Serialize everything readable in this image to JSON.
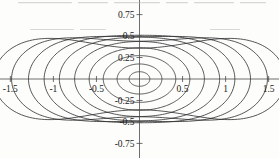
{
  "figure": {
    "kind": "contour-plot",
    "background_color": "#fdfdfc",
    "line_color": "#2b2b2b",
    "axis_color": "#4a4a4a",
    "label_color": "#1a1a1a"
  },
  "axes": {
    "x_label": "",
    "y_label": "",
    "x_ticks": [
      {
        "value": -1.5,
        "label": "-1.5"
      },
      {
        "value": -1.0,
        "label": "-1"
      },
      {
        "value": -0.5,
        "label": "-0.5"
      },
      {
        "value": 0.5,
        "label": "0.5"
      },
      {
        "value": 1.0,
        "label": "1"
      },
      {
        "value": 1.5,
        "label": "1.5"
      }
    ],
    "y_ticks": [
      {
        "value": 0.75,
        "label": "0.75"
      },
      {
        "value": 0.5,
        "label": "0.5"
      },
      {
        "value": 0.25,
        "label": "0.25"
      },
      {
        "value": -0.25,
        "label": "-0.25"
      },
      {
        "value": -0.5,
        "label": "-0.5"
      },
      {
        "value": -0.75,
        "label": "-0.75"
      }
    ],
    "xlim": [
      -1.62,
      1.62
    ],
    "ylim": [
      -0.92,
      0.92
    ],
    "grid": false,
    "spine_style": "cross-through-origin"
  },
  "chart_data": {
    "type": "line",
    "subtype": "contour",
    "title": "",
    "xlabel": "",
    "ylabel": "",
    "xlim": [
      -1.62,
      1.62
    ],
    "ylim": [
      -0.92,
      0.92
    ],
    "grid": false,
    "legend": false,
    "center": [
      0.0,
      0.0
    ],
    "n_contours": 10,
    "contours": [
      {
        "index": 1,
        "x_extent": 0.12,
        "y_extent": 0.085,
        "waist": 1.0,
        "shape": "ellipse"
      },
      {
        "index": 2,
        "x_extent": 0.26,
        "y_extent": 0.175,
        "waist": 1.0,
        "shape": "ellipse"
      },
      {
        "index": 3,
        "x_extent": 0.42,
        "y_extent": 0.275,
        "waist": 0.99,
        "shape": "ellipse"
      },
      {
        "index": 4,
        "x_extent": 0.58,
        "y_extent": 0.375,
        "waist": 0.97,
        "shape": "ellipse"
      },
      {
        "index": 5,
        "x_extent": 0.74,
        "y_extent": 0.47,
        "waist": 0.93,
        "shape": "rounded"
      },
      {
        "index": 6,
        "x_extent": 0.9,
        "y_extent": 0.56,
        "waist": 0.87,
        "shape": "rounded"
      },
      {
        "index": 7,
        "x_extent": 1.05,
        "y_extent": 0.645,
        "waist": 0.79,
        "shape": "waisted"
      },
      {
        "index": 8,
        "x_extent": 1.19,
        "y_extent": 0.725,
        "waist": 0.68,
        "shape": "waisted"
      },
      {
        "index": 9,
        "x_extent": 1.33,
        "y_extent": 0.8,
        "waist": 0.55,
        "shape": "saddle"
      },
      {
        "index": 10,
        "x_extent": 1.47,
        "y_extent": 0.875,
        "waist": 0.41,
        "shape": "saddle"
      }
    ],
    "x_axis_crossings_right": [
      0.12,
      0.26,
      0.42,
      0.58,
      0.74,
      0.9,
      1.05,
      1.19,
      1.33,
      1.47
    ],
    "x_axis_crossings_left": [
      -0.12,
      -0.26,
      -0.42,
      -0.58,
      -0.74,
      -0.9,
      -1.05,
      -1.19,
      -1.33,
      -1.47
    ],
    "y_axis_crossings_up": [
      0.085,
      0.175,
      0.275,
      0.375,
      0.44,
      0.5,
      0.56,
      0.62,
      0.68,
      0.74
    ],
    "y_axis_crossings_down": [
      -0.085,
      -0.175,
      -0.275,
      -0.375,
      -0.44,
      -0.5,
      -0.56,
      -0.62,
      -0.68,
      -0.74
    ]
  }
}
